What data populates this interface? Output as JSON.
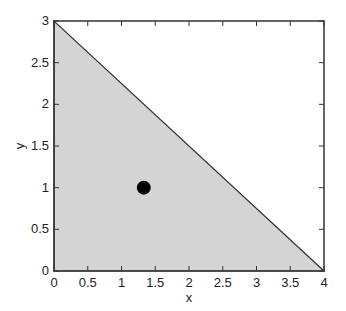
{
  "chart_data": {
    "type": "scatter",
    "title": "",
    "xlabel": "x",
    "ylabel": "y",
    "xlim": [
      0,
      4
    ],
    "ylim": [
      0,
      3
    ],
    "xticks": [
      0,
      0.5,
      1,
      1.5,
      2,
      2.5,
      3,
      3.5,
      4
    ],
    "xtick_labels": [
      "0",
      "0.5",
      "1",
      "1.5",
      "2",
      "2.5",
      "3",
      "3.5",
      "4"
    ],
    "yticks": [
      0,
      0.5,
      1,
      1.5,
      2,
      2.5,
      3
    ],
    "ytick_labels": [
      "0",
      "0.5",
      "1",
      "1.5",
      "2",
      "2.5",
      "3"
    ],
    "grid": false,
    "legend": null,
    "shaded_region": {
      "description": "feasible triangle under line from (0,3) to (4,0)",
      "vertices": [
        [
          0,
          0
        ],
        [
          0,
          3
        ],
        [
          4,
          0
        ]
      ],
      "fill_color": "#d4d4d4",
      "edge_color": "#333333"
    },
    "points": [
      {
        "x": 1.33,
        "y": 1.0,
        "color": "#000000",
        "marker": "filled-circle"
      }
    ]
  },
  "colors": {
    "region_fill": "#d4d4d4",
    "axes": "#333333",
    "point": "#000000"
  }
}
